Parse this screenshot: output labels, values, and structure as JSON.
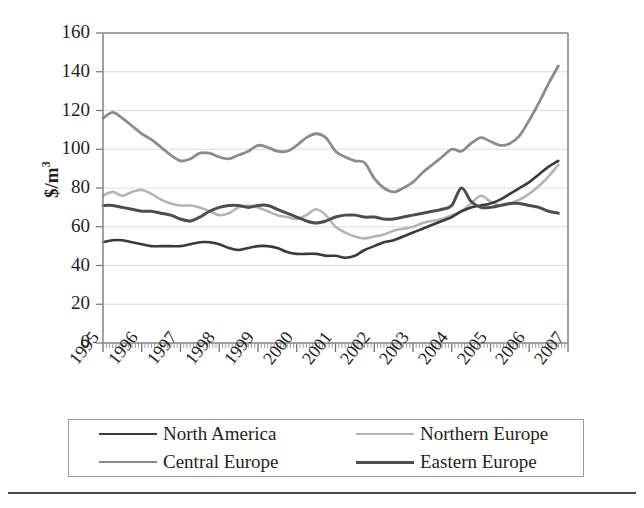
{
  "chart_data": {
    "type": "line",
    "title": "",
    "xlabel": "",
    "ylabel": "$/m3",
    "ylabel_display": "$/m",
    "ylabel_exponent": "3",
    "ylim": [
      0,
      160
    ],
    "ytick_step": 20,
    "yticks": [
      160,
      140,
      120,
      100,
      80,
      60,
      40,
      20,
      0
    ],
    "xlim": [
      1995,
      2007
    ],
    "xticks": [
      "1995",
      "1996",
      "1997",
      "1998",
      "1999",
      "2000",
      "2001",
      "2002",
      "2003",
      "2004",
      "2005",
      "2006",
      "2007"
    ],
    "grid": "horizontal",
    "legend_position": "below-axes",
    "x": [
      1995.0,
      1995.25,
      1995.5,
      1995.75,
      1996.0,
      1996.25,
      1996.5,
      1996.75,
      1997.0,
      1997.25,
      1997.5,
      1997.75,
      1998.0,
      1998.25,
      1998.5,
      1998.75,
      1999.0,
      1999.25,
      1999.5,
      1999.75,
      2000.0,
      2000.25,
      2000.5,
      2000.75,
      2001.0,
      2001.25,
      2001.5,
      2001.75,
      2002.0,
      2002.25,
      2002.5,
      2002.75,
      2003.0,
      2003.25,
      2003.5,
      2003.75,
      2004.0,
      2004.25,
      2004.5,
      2004.75,
      2005.0,
      2005.25,
      2005.5,
      2005.75,
      2006.0,
      2006.25,
      2006.5,
      2006.75
    ],
    "series": [
      {
        "name": "North America",
        "color": "#3a3a3a",
        "width": 2.6,
        "values": [
          52,
          53,
          53,
          52,
          51,
          50,
          50,
          50,
          50,
          51,
          52,
          52,
          51,
          49,
          48,
          49,
          50,
          50,
          49,
          47,
          46,
          46,
          46,
          45,
          45,
          44,
          45,
          48,
          50,
          52,
          53,
          55,
          57,
          59,
          61,
          63,
          65,
          68,
          70,
          71,
          72,
          74,
          77,
          80,
          83,
          87,
          91,
          94
        ]
      },
      {
        "name": "Northern Europe",
        "color": "#b4b4b4",
        "width": 2.6,
        "values": [
          76,
          78,
          76,
          78,
          79,
          77,
          74,
          72,
          71,
          71,
          70,
          68,
          66,
          67,
          70,
          71,
          70,
          68,
          66,
          65,
          64,
          66,
          69,
          66,
          60,
          57,
          55,
          54,
          55,
          56,
          58,
          59,
          60,
          62,
          63,
          64,
          66,
          68,
          72,
          76,
          73,
          71,
          72,
          74,
          77,
          81,
          86,
          92
        ]
      },
      {
        "name": "Central Europe",
        "color": "#8c8c8c",
        "width": 2.8,
        "values": [
          116,
          119,
          116,
          112,
          108,
          105,
          101,
          97,
          94,
          95,
          98,
          98,
          96,
          95,
          97,
          99,
          102,
          101,
          99,
          99,
          102,
          106,
          108,
          106,
          99,
          96,
          94,
          93,
          85,
          80,
          78,
          80,
          83,
          88,
          92,
          96,
          100,
          99,
          103,
          106,
          104,
          102,
          103,
          107,
          115,
          124,
          134,
          143
        ]
      },
      {
        "name": "Eastern Europe",
        "color": "#4d4d4d",
        "width": 3.0,
        "values": [
          71,
          71,
          70,
          69,
          68,
          68,
          67,
          66,
          64,
          63,
          65,
          68,
          70,
          71,
          71,
          70,
          71,
          71,
          69,
          67,
          65,
          63,
          62,
          63,
          65,
          66,
          66,
          65,
          65,
          64,
          64,
          65,
          66,
          67,
          68,
          69,
          71,
          80,
          73,
          70,
          70,
          71,
          72,
          72,
          71,
          70,
          68,
          67
        ]
      }
    ]
  },
  "axes": {
    "y_title_main": "$/m",
    "y_title_sup": "3"
  },
  "legend": {
    "items": [
      {
        "label": "North America",
        "color": "#3a3a3a",
        "width": "2.6px"
      },
      {
        "label": "Northern Europe",
        "color": "#b4b4b4",
        "width": "2.6px"
      },
      {
        "label": "Central Europe",
        "color": "#8c8c8c",
        "width": "2.8px"
      },
      {
        "label": "Eastern Europe",
        "color": "#4d4d4d",
        "width": "3.0px"
      }
    ]
  }
}
